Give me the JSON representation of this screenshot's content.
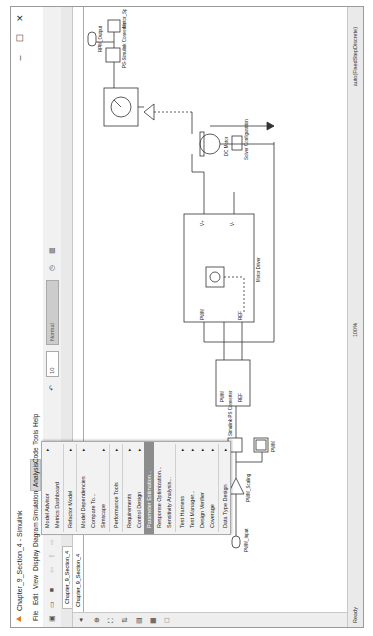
{
  "window": {
    "title": "Chapter_9_Section_4 - Simulink",
    "controls": {
      "close": "✕",
      "maximize": "☐",
      "minimize": "–"
    }
  },
  "menubar": [
    "File",
    "Edit",
    "View",
    "Display",
    "Diagram",
    "Simulation",
    "Analysis",
    "Code",
    "Tools",
    "Help"
  ],
  "toolbar": {
    "stop_time": "10",
    "sim_mode": "Normal"
  },
  "tab": {
    "label": "Chapter_9_Section_4"
  },
  "breadcrumb": {
    "label": "Chapter_9_Section_4"
  },
  "analysis_menu": {
    "items": [
      {
        "label": "Model Advisor",
        "submenu": true
      },
      {
        "label": "Metrics Dashboard",
        "submenu": false
      },
      {
        "sep": true
      },
      {
        "label": "Refactor Model",
        "submenu": true
      },
      {
        "sep": true
      },
      {
        "label": "Model Dependencies",
        "submenu": true
      },
      {
        "label": "Compare To...",
        "submenu": false
      },
      {
        "label": "Simscape",
        "submenu": true
      },
      {
        "sep": true
      },
      {
        "label": "Performance Tools",
        "submenu": true
      },
      {
        "sep": true
      },
      {
        "label": "Requirements",
        "submenu": true
      },
      {
        "label": "Control Design",
        "submenu": true
      },
      {
        "label": "Parameter Estimation...",
        "submenu": false,
        "highlighted": true
      },
      {
        "label": "Response Optimization...",
        "submenu": false
      },
      {
        "label": "Sensitivity Analysis...",
        "submenu": false
      },
      {
        "sep": true
      },
      {
        "label": "Test Harness",
        "submenu": true
      },
      {
        "label": "Test Manager...",
        "submenu": true
      },
      {
        "label": "Design Verifier",
        "submenu": true
      },
      {
        "label": "Coverage",
        "submenu": true
      },
      {
        "sep": true
      },
      {
        "label": "Data Type Design",
        "submenu": true
      }
    ]
  },
  "diagram": {
    "blocks": {
      "pwm_input": "PWM_Input",
      "pwm_scaling": "PWM_Scaling",
      "pwm_scope": "PWM",
      "converter_in": "Simulink-PS Converter",
      "motor_driver": "Motor Driver",
      "driver_ports": [
        "PWM",
        "REF",
        "V+",
        "V-"
      ],
      "controlled_pwm_ports": [
        "PWM",
        "REF"
      ],
      "dc_motor": "DC Motor",
      "solver": "Solver Configuration",
      "sensor_out": "PS-Simulink Converter",
      "speed_scope": "Motor_Speed",
      "rpm_output": "RPM_Output"
    },
    "signal_labels": {
      "scaled": "Scaled",
      "raw": "Duty"
    }
  },
  "status": {
    "left": "Ready",
    "zoom": "100%",
    "solver": "auto(FixedStepDiscrete)"
  }
}
